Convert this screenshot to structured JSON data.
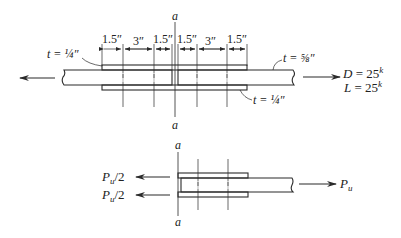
{
  "top_diagram": {
    "section_label_top": "a",
    "section_label_bottom": "a",
    "dimensions": [
      "1.5″",
      "3″",
      "1.5″",
      "1.5″",
      "3″",
      "1.5″"
    ],
    "thickness_top_left": "t = ¼″",
    "thickness_main": "t = ⅝″",
    "thickness_bottom_right": "t = ¼″",
    "load_dead_var": "D",
    "load_dead_eq": " = 25",
    "load_dead_unit": "k",
    "load_live_var": "L",
    "load_live_eq": " = 25",
    "load_live_unit": "k"
  },
  "bottom_diagram": {
    "section_label_top": "a",
    "section_label_bottom": "a",
    "force_top_left": "P",
    "force_top_left_sub": "u",
    "force_top_left_tail": "/2",
    "force_bottom_left": "P",
    "force_bottom_left_sub": "u",
    "force_bottom_left_tail": "/2",
    "force_right": "P",
    "force_right_sub": "u"
  },
  "colors": {
    "line": "#2a2a2a",
    "background": "#ffffff"
  }
}
